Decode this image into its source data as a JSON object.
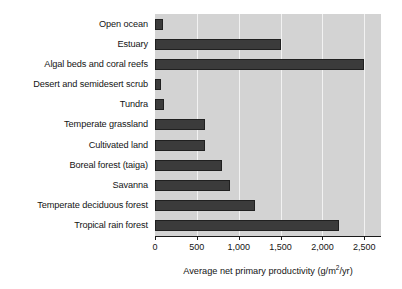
{
  "chart_data": {
    "type": "bar",
    "orientation": "horizontal",
    "title": "",
    "subtitle": "",
    "xlabel": "Average net primary productivity (g/m2/yr)",
    "xlabel_parts": {
      "before": "Average net primary productivity (g/m",
      "superscript": "2",
      "after": "/yr)"
    },
    "ylabel": "",
    "categories": [
      "Open ocean",
      "Estuary",
      "Algal beds and coral reefs",
      "Desert and semidesert scrub",
      "Tundra",
      "Temperate grassland",
      "Cultivated land",
      "Boreal forest (taiga)",
      "Savanna",
      "Temperate deciduous forest",
      "Tropical rain forest"
    ],
    "values": [
      90,
      1500,
      2500,
      70,
      110,
      600,
      600,
      800,
      900,
      1200,
      2200
    ],
    "xlim": [
      0,
      2700
    ],
    "xticks": [
      0,
      500,
      1000,
      1500,
      2000,
      2500
    ],
    "xtick_labels": [
      "0",
      "500",
      "1,000",
      "1,500",
      "2,000",
      "2,500"
    ],
    "grid": "vertical",
    "legend": "none",
    "colors": {
      "bar_fill": "#3b3b3b",
      "bar_edge": "#202020",
      "plot_background": "#d3d3d3",
      "gridline": "#f2f2f2",
      "axis": "#1a1a1a",
      "text": "#141414",
      "figure_background": "#ffffff"
    }
  }
}
